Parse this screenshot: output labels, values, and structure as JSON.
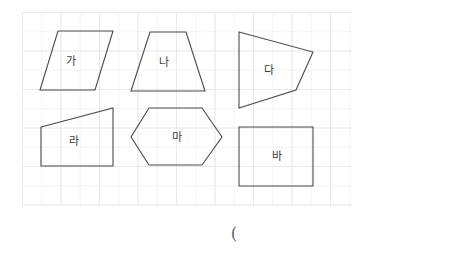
{
  "page": {
    "background_color": "#ffffff",
    "width": 454,
    "height": 254
  },
  "grid": {
    "name": "graph-paper-grid",
    "left": 22,
    "top": 12,
    "width": 330,
    "height": 194,
    "minor_spacing": 19.25,
    "major_spacing": 38.5,
    "minor_color": "#f4f4f6",
    "major_color": "#e9e9ec"
  },
  "figure": {
    "stroke_color": "#4a4a4a",
    "stroke_width": 1.1,
    "fill": "none",
    "shapes": [
      {
        "id": "ga",
        "label": "가",
        "type": "parallelogram",
        "points": "58,31 113,31 95,90 40,90",
        "label_x": 71,
        "label_y": 61
      },
      {
        "id": "na",
        "label": "나",
        "type": "trapezoid",
        "points": "150,32 186,32 205,91 131,91",
        "label_x": 164,
        "label_y": 62
      },
      {
        "id": "da",
        "label": "다",
        "type": "quadrilateral",
        "points": "239,32 313,52 296,90 239,108",
        "label_x": 269,
        "label_y": 70
      },
      {
        "id": "ra",
        "label": "라",
        "type": "right-trapezoid",
        "points": "41,127 113,108 113,166 41,166",
        "label_x": 74,
        "label_y": 141
      },
      {
        "id": "ma",
        "label": "마",
        "type": "hexagon",
        "points": "149,108 202,108 222,137 202,165 149,165 131,137",
        "label_x": 177,
        "label_y": 137
      },
      {
        "id": "ba",
        "label": "바",
        "type": "rectangle",
        "points": "239,127 313,127 313,186 239,186",
        "label_x": 277,
        "label_y": 156
      }
    ]
  },
  "answer": {
    "name": "answer-parenthesis",
    "text": "(",
    "x": 234,
    "y": 233
  }
}
